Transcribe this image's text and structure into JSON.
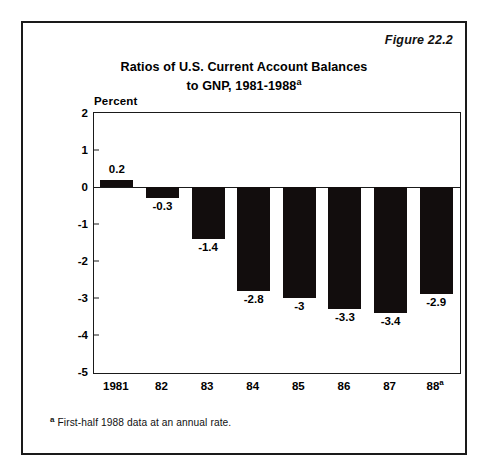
{
  "figure": {
    "label": "Figure 22.2",
    "title_line1": "Ratios of U.S. Current Account Balances",
    "title_line2": "to GNP, 1981-1988",
    "title_superscript": "a",
    "footnote_marker": "a",
    "footnote_text": "First-half 1988 data at an annual rate."
  },
  "chart_data": {
    "type": "bar",
    "title": "Ratios of U.S. Current Account Balances to GNP, 1981-1988a",
    "xlabel": "",
    "ylabel": "Percent",
    "categories": [
      "1981",
      "82",
      "83",
      "84",
      "85",
      "86",
      "87",
      "88"
    ],
    "tick_superscripts": [
      "",
      "",
      "",
      "",
      "",
      "",
      "",
      "a"
    ],
    "values": [
      0.2,
      -0.3,
      -1.4,
      -2.8,
      -3,
      -3.3,
      -3.4,
      -2.9
    ],
    "data_labels": [
      "0.2",
      "-0.3",
      "-1.4",
      "-2.8",
      "-3",
      "-3.3",
      "-3.4",
      "-2.9"
    ],
    "ylim": [
      -5,
      2
    ],
    "ytick_values": [
      2,
      1,
      0,
      -1,
      -2,
      -3,
      -4,
      -5
    ],
    "ytick_labels": [
      "2",
      "1",
      "0",
      "-1",
      "-2",
      "-3",
      "-4",
      "-5"
    ],
    "zero_line": 0,
    "grid": false,
    "legend": "none",
    "bar_color": "#120d0d",
    "axis_color": "#1a1a1a",
    "background_color": "#ffffff"
  }
}
